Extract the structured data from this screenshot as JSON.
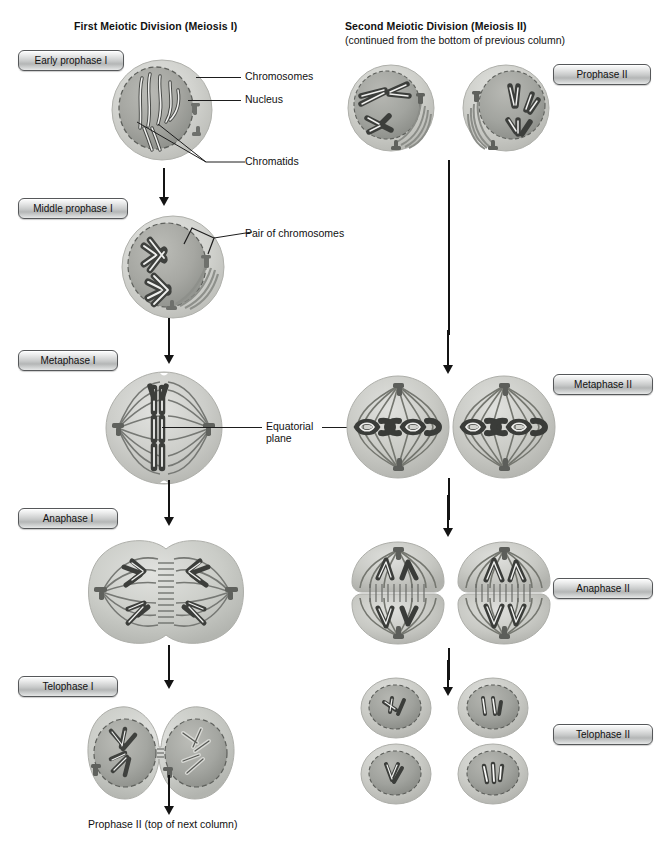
{
  "columns": {
    "left": {
      "heading": "First Meiotic Division (Meiosis I)"
    },
    "right": {
      "heading": "Second Meiotic Division (Meiosis II)",
      "subheading": "(continued from the bottom of previous column)"
    }
  },
  "stage_labels": {
    "early_prophase_i": "Early prophase I",
    "middle_prophase_i": "Middle prophase I",
    "metaphase_i": "Metaphase I",
    "anaphase_i": "Anaphase I",
    "telophase_i": "Telophase I",
    "prophase_ii": "Prophase II",
    "metaphase_ii": "Metaphase II",
    "anaphase_ii": "Anaphase II",
    "telophase_ii": "Telophase II"
  },
  "callouts": {
    "chromosomes": "Chromosomes",
    "nucleus": "Nucleus",
    "chromatids": "Chromatids",
    "pair_of_chromosomes": "Pair of chromosomes",
    "equatorial_plane_line1": "Equatorial",
    "equatorial_plane_line2": "plane"
  },
  "caption": {
    "bottom": "Prophase II (top of next column)"
  },
  "colors": {
    "background": "#ffffff",
    "text": "#111111",
    "line": "#1d1d1d",
    "arrow": "#141414",
    "cytoplasm_light": "#d8d9d6",
    "cytoplasm_mid": "#c2c3bf",
    "nucleus": "#a9aaa6",
    "chromosome_dark": "#3a3c3a",
    "chromosome_light": "#f2f2f0",
    "pill_border": "#56585a"
  }
}
